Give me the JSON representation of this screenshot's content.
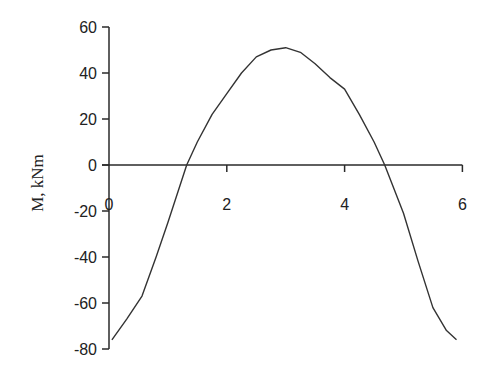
{
  "chart_data": {
    "type": "line",
    "title": "",
    "xlabel": "",
    "ylabel": "M, kNm",
    "xlim": [
      0,
      6
    ],
    "ylim": [
      -80,
      60
    ],
    "x_ticks": [
      0,
      2,
      4,
      6
    ],
    "y_ticks": [
      60,
      40,
      20,
      0,
      -20,
      -40,
      -60,
      -80
    ],
    "x_tick_labels": [
      "0",
      "2",
      "4",
      "6"
    ],
    "y_tick_labels": [
      "60",
      "40",
      "20",
      "0",
      "-20",
      "-40",
      "-60",
      "-80"
    ],
    "grid": false,
    "legend": null,
    "series": [
      {
        "name": "M",
        "color": "#333333",
        "x": [
          0.05,
          0.3,
          0.56,
          0.8,
          1.0,
          1.32,
          1.5,
          1.75,
          2.0,
          2.25,
          2.5,
          2.75,
          3.0,
          3.25,
          3.5,
          3.75,
          4.0,
          4.25,
          4.5,
          4.68,
          5.0,
          5.25,
          5.5,
          5.73,
          5.9
        ],
        "y": [
          -76,
          -67,
          -57,
          -40,
          -25,
          0,
          10,
          22,
          31,
          40,
          47,
          50,
          51,
          49,
          44,
          38,
          33,
          22,
          10,
          0,
          -21,
          -42,
          -62,
          -72,
          -76
        ]
      }
    ]
  }
}
